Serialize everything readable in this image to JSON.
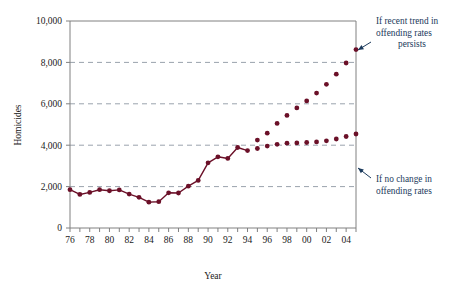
{
  "chart_data": {
    "type": "line",
    "title": "",
    "xlabel": "Year",
    "ylabel": "Homicides",
    "xlim": [
      1976,
      2005
    ],
    "ylim": [
      0,
      10000
    ],
    "grid": true,
    "grid_values": [
      2000,
      4000,
      6000,
      8000
    ],
    "legend_position": "annotations-right",
    "y_ticks": [
      0,
      2000,
      4000,
      6000,
      8000,
      10000
    ],
    "y_tick_labels": [
      "0",
      "2,000",
      "4,000",
      "6,000",
      "8,000",
      "10,000"
    ],
    "x_ticks": [
      1976,
      1977,
      1978,
      1979,
      1980,
      1981,
      1982,
      1983,
      1984,
      1985,
      1986,
      1987,
      1988,
      1989,
      1990,
      1991,
      1992,
      1993,
      1994,
      1995,
      1996,
      1997,
      1998,
      1999,
      2000,
      2001,
      2002,
      2003,
      2004,
      2005
    ],
    "x_tick_labels": [
      "76",
      "",
      "78",
      "",
      "80",
      "",
      "82",
      "",
      "84",
      "",
      "86",
      "",
      "88",
      "",
      "90",
      "",
      "92",
      "",
      "94",
      "",
      "96",
      "",
      "98",
      "",
      "00",
      "",
      "02",
      "",
      "04",
      ""
    ],
    "series": [
      {
        "name": "Historical homicides",
        "style": "solid-line-with-markers",
        "color": "#6B1028",
        "x": [
          1976,
          1977,
          1978,
          1979,
          1980,
          1981,
          1982,
          1983,
          1984,
          1985,
          1986,
          1987,
          1988,
          1989,
          1990,
          1991,
          1992,
          1993,
          1994
        ],
        "values": [
          1850,
          1620,
          1720,
          1850,
          1800,
          1840,
          1640,
          1480,
          1250,
          1270,
          1700,
          1690,
          2020,
          2300,
          3150,
          3440,
          3360,
          3890,
          3740
        ]
      },
      {
        "name": "If recent trend in offending rates persists",
        "style": "dotted-markers",
        "color": "#6B1028",
        "x": [
          1995,
          1996,
          1997,
          1998,
          1999,
          2000,
          2001,
          2002,
          2003,
          2004,
          2005
        ],
        "values": [
          4250,
          4580,
          5050,
          5440,
          5800,
          6140,
          6520,
          6940,
          7430,
          7970,
          8620
        ]
      },
      {
        "name": "If no change in offending rates",
        "style": "dotted-markers",
        "color": "#6B1028",
        "x": [
          1995,
          1996,
          1997,
          1998,
          1999,
          2000,
          2001,
          2002,
          2003,
          2004,
          2005
        ],
        "values": [
          3840,
          3960,
          4040,
          4100,
          4110,
          4130,
          4160,
          4210,
          4300,
          4420,
          4540
        ]
      }
    ],
    "annotations": [
      {
        "id": "upper",
        "lines": [
          "If recent trend in",
          "offending rates",
          "persists"
        ],
        "color": "#1b3a5c",
        "points_to": [
          2005,
          8620
        ]
      },
      {
        "id": "lower",
        "lines": [
          "If no change in",
          "offending rates"
        ],
        "color": "#1b3a5c",
        "points_to": [
          2005,
          4540
        ]
      }
    ],
    "colors": {
      "series": "#6B1028",
      "annotation": "#1b3a5c",
      "grid": "#9aa3ad",
      "axis": "#808080"
    }
  }
}
